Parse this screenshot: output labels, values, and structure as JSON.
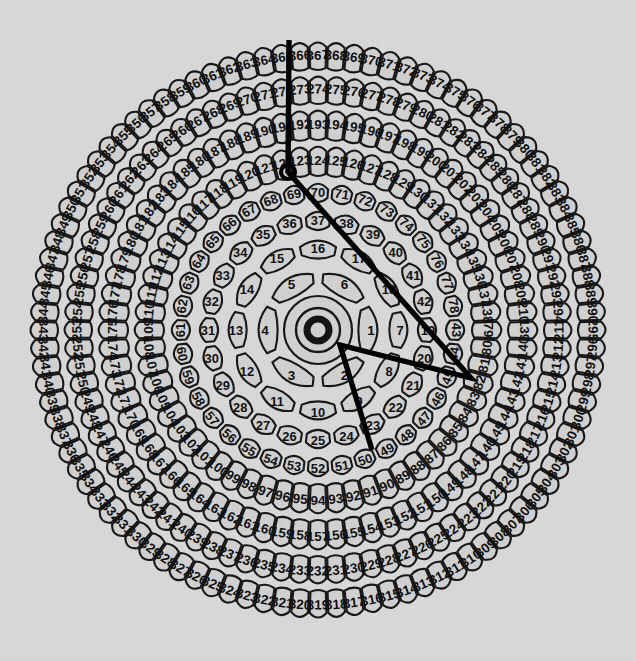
{
  "figure": {
    "type": "radial-cell-diagram",
    "background_color": "#d9d9d9",
    "cell_fill_color": "#d2d2d2",
    "ink_color": "#171717",
    "overlay_color": "#000000",
    "center": {
      "x": 318,
      "y": 330
    },
    "hub": {
      "core_radius": 11,
      "ring_radii": [
        22,
        34
      ],
      "label": "center-hub"
    }
  },
  "chart_data": {
    "type": "radial-cell-diagram",
    "numbering_scheme": "sequential-1-based-outward-counterclockwise-start-right",
    "ring_count": 8,
    "rings": [
      {
        "index": 1,
        "count": 6,
        "first": 1,
        "last": 6,
        "r_inner": 38,
        "r_outer": 68,
        "label_r": 53,
        "start_angle_deg": -30,
        "shape": "round-petal"
      },
      {
        "index": 2,
        "count": 12,
        "first": 7,
        "last": 18,
        "r_inner": 68,
        "r_outer": 96,
        "label_r": 82,
        "start_angle_deg": -15,
        "shape": "round-petal"
      },
      {
        "index": 3,
        "count": 24,
        "first": 19,
        "last": 42,
        "r_inner": 96,
        "r_outer": 124,
        "label_r": 110,
        "start_angle_deg": -7.5,
        "shape": "round-petal"
      },
      {
        "index": 4,
        "count": 36,
        "first": 43,
        "last": 78,
        "r_inner": 124,
        "r_outer": 152,
        "label_r": 138,
        "start_angle_deg": -5,
        "shape": "round-petal"
      },
      {
        "index": 5,
        "count": 60,
        "first": 79,
        "last": 138,
        "r_inner": 152,
        "r_outer": 188,
        "label_r": 170,
        "start_angle_deg": -3,
        "shape": "capsule"
      },
      {
        "index": 6,
        "count": 72,
        "first": 139,
        "last": 210,
        "r_inner": 188,
        "r_outer": 224,
        "label_r": 206,
        "start_angle_deg": -2.5,
        "shape": "capsule"
      },
      {
        "index": 7,
        "count": 84,
        "first": 211,
        "last": 294,
        "r_inner": 224,
        "r_outer": 258,
        "label_r": 241,
        "start_angle_deg": -2.1,
        "shape": "capsule"
      },
      {
        "index": 8,
        "count": 96,
        "first": 295,
        "last": 390,
        "r_inner": 258,
        "r_outer": 292,
        "label_r": 275,
        "start_angle_deg": -1.9,
        "shape": "capsule"
      }
    ],
    "value_range": [
      1,
      390
    ]
  },
  "overlay": {
    "name": "polyline-annotation",
    "stroke_color": "#000000",
    "stroke_width": 5.4,
    "vertices": [
      {
        "x": 289,
        "y": 40,
        "note": "top apex near cell 312"
      },
      {
        "x": 288,
        "y": 172,
        "note": "marker vertex near cell 80"
      },
      {
        "x": 471,
        "y": 378,
        "note": "right vertex near cell 98"
      },
      {
        "x": 340,
        "y": 345,
        "note": "inner vertex near center"
      },
      {
        "x": 372,
        "y": 450,
        "note": "lower terminus near cell 61"
      }
    ],
    "marker": {
      "x": 288,
      "y": 172,
      "radius": 7,
      "name": "vertex-marker"
    }
  }
}
